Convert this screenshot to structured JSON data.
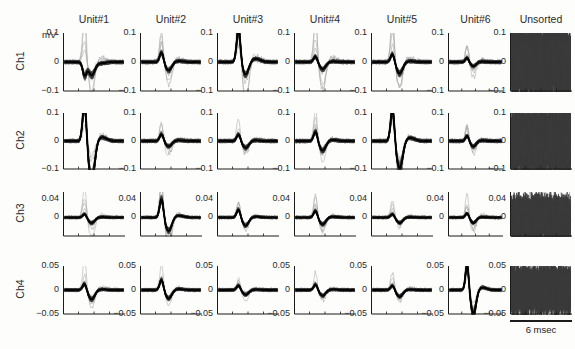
{
  "figure": {
    "unit_axis_label": "mV",
    "column_titles": [
      "Unit#1",
      "Unit#2",
      "Unit#3",
      "Unit#4",
      "Unit#5",
      "Unit#6",
      "Unsorted"
    ],
    "row_labels": [
      "Ch1",
      "Ch2",
      "Ch3",
      "Ch4"
    ],
    "scalebar_label": "6 msec",
    "colors": {
      "mean_trace": "#000000",
      "individual_traces": "#3a3a3a",
      "outlier_traces": "#a8a8a8",
      "axis": "#1b1b1b",
      "background": "#fdfdfc"
    }
  },
  "chart_data": {
    "type": "line",
    "title": "",
    "subtitle": "",
    "xlabel": "",
    "ylabel": "mV",
    "grid": false,
    "legend_position": "none",
    "x": {
      "label": "time",
      "unit": "msec",
      "range": [
        0,
        6
      ],
      "scalebar": 6,
      "tick_labels": []
    },
    "rows": [
      {
        "channel": "Ch1",
        "ylim": [
          -0.1,
          0.1
        ],
        "ytick_labels": [
          "0.1",
          "0",
          "-0.1"
        ],
        "ytick_values": [
          0.1,
          0,
          -0.1
        ],
        "unit": "mV",
        "panels": [
          {
            "column": "Unit#1",
            "n_traces": 60,
            "peak": -0.045,
            "trough": -0.045,
            "mean_amplitude": 0.05,
            "shape": "small biphasic dip near centre, flat elsewhere",
            "outlier_peak": 0.1
          },
          {
            "column": "Unit#2",
            "n_traces": 60,
            "peak": 0.035,
            "trough": -0.03,
            "mean_amplitude": 0.065,
            "shape": "small positive bump then shallow trough",
            "outlier_peak": 0.1
          },
          {
            "column": "Unit#3",
            "n_traces": 60,
            "peak": 0.115,
            "trough": -0.045,
            "mean_amplitude": 0.16,
            "shape": "large sharp positive peak followed by negative trough",
            "outlier_peak": 0.12
          },
          {
            "column": "Unit#4",
            "n_traces": 60,
            "peak": 0.02,
            "trough": -0.025,
            "mean_amplitude": 0.045,
            "shape": "nearly flat with small ripple",
            "outlier_peak": 0.09
          },
          {
            "column": "Unit#5",
            "n_traces": 60,
            "peak": 0.03,
            "trough": -0.04,
            "mean_amplitude": 0.07,
            "shape": "small positive then negative deflection",
            "outlier_peak": 0.09
          },
          {
            "column": "Unit#6",
            "n_traces": 40,
            "peak": 0.015,
            "trough": -0.015,
            "mean_amplitude": 0.03,
            "shape": "flat low-amplitude noise band",
            "outlier_peak": 0.05
          },
          {
            "column": "Unsorted",
            "n_traces": 300,
            "peak": 0.13,
            "trough": -0.13,
            "mean_amplitude": 0.26,
            "shape": "dense overlapping multi-phasic noise, fills panel",
            "outlier_peak": 0.14
          }
        ]
      },
      {
        "channel": "Ch2",
        "ylim": [
          -0.1,
          0.1
        ],
        "ytick_labels": [
          "0.1",
          "0",
          "-0.1"
        ],
        "ytick_values": [
          0.1,
          0,
          -0.1
        ],
        "unit": "mV",
        "panels": [
          {
            "column": "Unit#1",
            "n_traces": 60,
            "peak": 0.14,
            "trough": -0.14,
            "mean_amplitude": 0.28,
            "shape": "large sharp biphasic spike: tall positive peak then deep trough",
            "outlier_peak": 0.15
          },
          {
            "column": "Unit#2",
            "n_traces": 60,
            "peak": 0.025,
            "trough": -0.02,
            "mean_amplitude": 0.045,
            "shape": "flat with small centre ripple",
            "outlier_peak": 0.05
          },
          {
            "column": "Unit#3",
            "n_traces": 60,
            "peak": 0.025,
            "trough": -0.025,
            "mean_amplitude": 0.05,
            "shape": "small bump then shallow dip",
            "outlier_peak": 0.05
          },
          {
            "column": "Unit#4",
            "n_traces": 60,
            "peak": 0.035,
            "trough": -0.035,
            "mean_amplitude": 0.07,
            "shape": "moderate positive notch then dip",
            "outlier_peak": 0.06
          },
          {
            "column": "Unit#5",
            "n_traces": 60,
            "peak": 0.12,
            "trough": -0.1,
            "mean_amplitude": 0.22,
            "shape": "broad large positive peak followed by broad trough",
            "outlier_peak": 0.13
          },
          {
            "column": "Unit#6",
            "n_traces": 40,
            "peak": 0.02,
            "trough": -0.02,
            "mean_amplitude": 0.04,
            "shape": "low amplitude wiggle",
            "outlier_peak": 0.05
          },
          {
            "column": "Unsorted",
            "n_traces": 300,
            "peak": 0.13,
            "trough": -0.13,
            "mean_amplitude": 0.26,
            "shape": "dense overlapping noise spanning full range",
            "outlier_peak": 0.14
          }
        ]
      },
      {
        "channel": "Ch3",
        "ylim": [
          -0.04,
          0.055
        ],
        "ytick_labels": [
          "0.04",
          "0"
        ],
        "ytick_values": [
          0.04,
          0
        ],
        "unit": "mV",
        "panels": [
          {
            "column": "Unit#1",
            "n_traces": 60,
            "peak": 0.008,
            "trough": -0.012,
            "mean_amplitude": 0.02,
            "shape": "flat band with faint centre dip",
            "outlier_peak": 0.04
          },
          {
            "column": "Unit#2",
            "n_traces": 60,
            "peak": 0.042,
            "trough": -0.03,
            "mean_amplitude": 0.072,
            "shape": "sharp tall positive peak then trough",
            "outlier_peak": 0.055
          },
          {
            "column": "Unit#3",
            "n_traces": 60,
            "peak": 0.018,
            "trough": -0.018,
            "mean_amplitude": 0.036,
            "shape": "small biphasic bump",
            "outlier_peak": 0.035
          },
          {
            "column": "Unit#4",
            "n_traces": 60,
            "peak": 0.015,
            "trough": -0.015,
            "mean_amplitude": 0.03,
            "shape": "small centre deflection",
            "outlier_peak": 0.04
          },
          {
            "column": "Unit#5",
            "n_traces": 60,
            "peak": 0.008,
            "trough": -0.012,
            "mean_amplitude": 0.02,
            "shape": "flat noise band",
            "outlier_peak": 0.02
          },
          {
            "column": "Unit#6",
            "n_traces": 40,
            "peak": 0.01,
            "trough": -0.012,
            "mean_amplitude": 0.022,
            "shape": "flat band with large light-grey outlier hump",
            "outlier_peak": 0.045
          },
          {
            "column": "Unsorted",
            "n_traces": 300,
            "peak": 0.05,
            "trough": -0.035,
            "mean_amplitude": 0.085,
            "shape": "dense overlapping spikes with tall centre burst",
            "outlier_peak": 0.055
          }
        ]
      },
      {
        "channel": "Ch4",
        "ylim": [
          -0.05,
          0.05
        ],
        "ytick_labels": [
          "0.05",
          "0",
          "-0.05"
        ],
        "ytick_values": [
          0.05,
          0,
          -0.05
        ],
        "unit": "mV",
        "panels": [
          {
            "column": "Unit#1",
            "n_traces": 60,
            "peak": 0.014,
            "trough": -0.02,
            "mean_amplitude": 0.034,
            "shape": "small biphasic dip",
            "outlier_peak": 0.032
          },
          {
            "column": "Unit#2",
            "n_traces": 60,
            "peak": 0.022,
            "trough": -0.018,
            "mean_amplitude": 0.04,
            "shape": "modest positive bump then dip",
            "outlier_peak": 0.03
          },
          {
            "column": "Unit#3",
            "n_traces": 60,
            "peak": 0.01,
            "trough": -0.01,
            "mean_amplitude": 0.02,
            "shape": "flat low noise band",
            "outlier_peak": 0.018
          },
          {
            "column": "Unit#4",
            "n_traces": 60,
            "peak": 0.012,
            "trough": -0.012,
            "mean_amplitude": 0.024,
            "shape": "small centre ripple",
            "outlier_peak": 0.022
          },
          {
            "column": "Unit#5",
            "n_traces": 60,
            "peak": 0.01,
            "trough": -0.014,
            "mean_amplitude": 0.024,
            "shape": "flat with shallow dip",
            "outlier_peak": 0.02
          },
          {
            "column": "Unit#6",
            "n_traces": 40,
            "peak": 0.055,
            "trough": -0.05,
            "mean_amplitude": 0.105,
            "shape": "large biphasic spike: tall positive peak then deep broad trough",
            "outlier_peak": 0.058
          },
          {
            "column": "Unsorted",
            "n_traces": 300,
            "peak": 0.055,
            "trough": -0.055,
            "mean_amplitude": 0.11,
            "shape": "dense overlapping noise filling panel",
            "outlier_peak": 0.06
          }
        ]
      }
    ]
  }
}
